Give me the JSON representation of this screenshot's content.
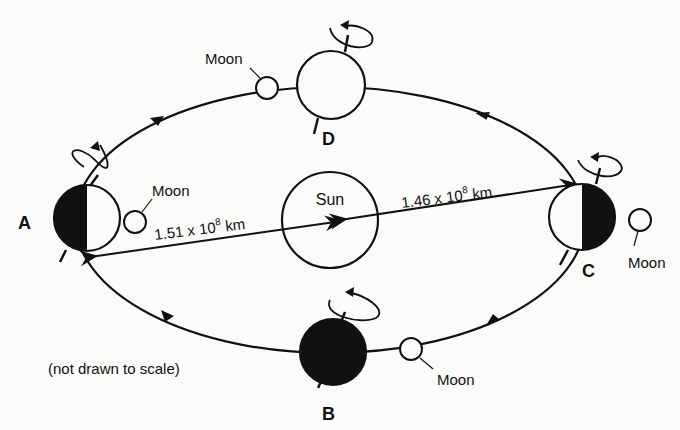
{
  "diagram": {
    "sun_label": "Sun",
    "note": "(not drawn to scale)",
    "positions": [
      {
        "id": "A",
        "label": "A",
        "moon_label": "Moon",
        "shading": "left-dark"
      },
      {
        "id": "B",
        "label": "B",
        "moon_label": "Moon",
        "shading": "full-dark"
      },
      {
        "id": "C",
        "label": "C",
        "moon_label": "Moon",
        "shading": "right-dark"
      },
      {
        "id": "D",
        "label": "D",
        "moon_label": "Moon",
        "shading": "lit"
      }
    ],
    "distances": {
      "aphelion_base": "1.51 x 10",
      "aphelion_exp": "8",
      "aphelion_unit": " km",
      "perihelion_base": "1.46 x 10",
      "perihelion_exp": "8",
      "perihelion_unit": " km"
    },
    "colors": {
      "ink": "#111111",
      "paper": "#fbfbf9"
    }
  }
}
